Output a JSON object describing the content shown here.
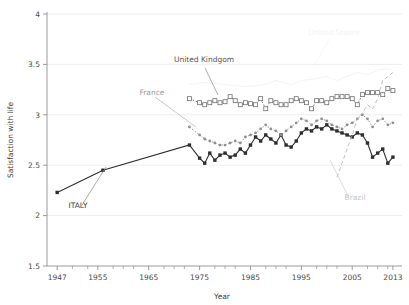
{
  "chart_data": {
    "type": "line",
    "title": "",
    "xlabel": "Year",
    "ylabel": "Satisfaction with life",
    "xlim": [
      1945,
      2014
    ],
    "ylim": [
      1.5,
      4
    ],
    "yticks": [
      "1.5",
      "2",
      "2.5",
      "3",
      "3.5",
      "4"
    ],
    "ytick_values": [
      1.5,
      2,
      2.5,
      3,
      3.5,
      4
    ],
    "xticks": [
      "1947",
      "1955",
      "1965",
      "1975",
      "1985",
      "1995",
      "2005",
      "2013"
    ],
    "xtick_values": [
      1947,
      1955,
      1965,
      1975,
      1985,
      1995,
      2005,
      2013
    ],
    "grid": "horizontal",
    "legend": "inline-annotations",
    "series": [
      {
        "name": "ITALY",
        "label": "ITALY",
        "color": "#2e2e2e",
        "marker": "filled-square",
        "linestyle": "solid",
        "points": [
          [
            1947,
            2.23
          ],
          [
            1956,
            2.45
          ],
          [
            1973,
            2.7
          ],
          [
            1975,
            2.57
          ],
          [
            1976,
            2.52
          ],
          [
            1977,
            2.62
          ],
          [
            1978,
            2.55
          ],
          [
            1979,
            2.6
          ],
          [
            1980,
            2.62
          ],
          [
            1981,
            2.58
          ],
          [
            1982,
            2.6
          ],
          [
            1983,
            2.66
          ],
          [
            1984,
            2.62
          ],
          [
            1985,
            2.7
          ],
          [
            1986,
            2.78
          ],
          [
            1987,
            2.74
          ],
          [
            1988,
            2.8
          ],
          [
            1989,
            2.76
          ],
          [
            1990,
            2.72
          ],
          [
            1991,
            2.8
          ],
          [
            1992,
            2.7
          ],
          [
            1993,
            2.68
          ],
          [
            1994,
            2.74
          ],
          [
            1995,
            2.82
          ],
          [
            1996,
            2.86
          ],
          [
            1997,
            2.84
          ],
          [
            1998,
            2.88
          ],
          [
            1999,
            2.86
          ],
          [
            2000,
            2.9
          ],
          [
            2001,
            2.86
          ],
          [
            2002,
            2.84
          ],
          [
            2003,
            2.82
          ],
          [
            2004,
            2.8
          ],
          [
            2005,
            2.78
          ],
          [
            2006,
            2.82
          ],
          [
            2007,
            2.8
          ],
          [
            2008,
            2.72
          ],
          [
            2009,
            2.58
          ],
          [
            2010,
            2.62
          ],
          [
            2011,
            2.66
          ],
          [
            2012,
            2.52
          ],
          [
            2013,
            2.58
          ]
        ]
      },
      {
        "name": "France",
        "label": "France",
        "color": "#8f8f8f",
        "marker": "small-dot",
        "linestyle": "dotted",
        "points": [
          [
            1973,
            2.88
          ],
          [
            1975,
            2.8
          ],
          [
            1976,
            2.76
          ],
          [
            1977,
            2.74
          ],
          [
            1978,
            2.72
          ],
          [
            1979,
            2.7
          ],
          [
            1980,
            2.7
          ],
          [
            1981,
            2.72
          ],
          [
            1982,
            2.74
          ],
          [
            1983,
            2.72
          ],
          [
            1984,
            2.78
          ],
          [
            1985,
            2.8
          ],
          [
            1986,
            2.82
          ],
          [
            1987,
            2.86
          ],
          [
            1988,
            2.9
          ],
          [
            1989,
            2.86
          ],
          [
            1990,
            2.84
          ],
          [
            1991,
            2.8
          ],
          [
            1992,
            2.84
          ],
          [
            1993,
            2.88
          ],
          [
            1994,
            2.92
          ],
          [
            1995,
            2.96
          ],
          [
            1996,
            2.94
          ],
          [
            1997,
            2.9
          ],
          [
            1998,
            2.94
          ],
          [
            1999,
            2.96
          ],
          [
            2000,
            2.94
          ],
          [
            2001,
            2.9
          ],
          [
            2002,
            2.88
          ],
          [
            2003,
            2.86
          ],
          [
            2004,
            2.9
          ],
          [
            2005,
            2.92
          ],
          [
            2006,
            2.96
          ],
          [
            2007,
            3.0
          ],
          [
            2008,
            2.96
          ],
          [
            2009,
            2.88
          ],
          [
            2010,
            2.94
          ],
          [
            2011,
            2.96
          ],
          [
            2012,
            2.9
          ],
          [
            2013,
            2.92
          ]
        ]
      },
      {
        "name": "United Kindgom",
        "label": "United Kindgom",
        "color": "#6f6f6f",
        "marker": "open-square",
        "linestyle": "dotted",
        "points": [
          [
            1973,
            3.16
          ],
          [
            1975,
            3.12
          ],
          [
            1976,
            3.1
          ],
          [
            1977,
            3.12
          ],
          [
            1978,
            3.14
          ],
          [
            1979,
            3.12
          ],
          [
            1980,
            3.13
          ],
          [
            1981,
            3.18
          ],
          [
            1982,
            3.14
          ],
          [
            1983,
            3.1
          ],
          [
            1984,
            3.12
          ],
          [
            1985,
            3.11
          ],
          [
            1986,
            3.1
          ],
          [
            1987,
            3.16
          ],
          [
            1988,
            3.06
          ],
          [
            1989,
            3.14
          ],
          [
            1990,
            3.12
          ],
          [
            1991,
            3.1
          ],
          [
            1992,
            3.1
          ],
          [
            1993,
            3.14
          ],
          [
            1994,
            3.16
          ],
          [
            1995,
            3.14
          ],
          [
            1996,
            3.12
          ],
          [
            1997,
            3.06
          ],
          [
            1998,
            3.14
          ],
          [
            1999,
            3.14
          ],
          [
            2000,
            3.12
          ],
          [
            2001,
            3.16
          ],
          [
            2002,
            3.18
          ],
          [
            2003,
            3.18
          ],
          [
            2004,
            3.18
          ],
          [
            2005,
            3.16
          ],
          [
            2006,
            3.1
          ],
          [
            2007,
            3.2
          ],
          [
            2008,
            3.22
          ],
          [
            2009,
            3.22
          ],
          [
            2010,
            3.22
          ],
          [
            2011,
            3.2
          ],
          [
            2012,
            3.26
          ],
          [
            2013,
            3.24
          ]
        ]
      },
      {
        "name": "Brazil",
        "label": "Brazil",
        "color": "#b9b9b9",
        "marker": "none",
        "linestyle": "dashed",
        "points": [
          [
            2002,
            2.38
          ],
          [
            2003,
            2.52
          ],
          [
            2004,
            2.66
          ],
          [
            2005,
            2.8
          ],
          [
            2006,
            2.96
          ],
          [
            2007,
            3.02
          ],
          [
            2008,
            3.1
          ],
          [
            2009,
            3.06
          ],
          [
            2010,
            3.16
          ],
          [
            2011,
            3.34
          ],
          [
            2012,
            3.38
          ],
          [
            2013,
            3.42
          ]
        ]
      },
      {
        "name": "United States",
        "label": "United States",
        "color": "#f2f2f2",
        "marker": "none",
        "linestyle": "solid",
        "points": [
          [
            1973,
            3.3
          ],
          [
            1976,
            3.32
          ],
          [
            1980,
            3.3
          ],
          [
            1984,
            3.28
          ],
          [
            1988,
            3.3
          ],
          [
            1990,
            3.34
          ],
          [
            1993,
            3.3
          ],
          [
            1995,
            3.34
          ],
          [
            1998,
            3.36
          ],
          [
            2000,
            3.38
          ],
          [
            2002,
            3.34
          ],
          [
            2004,
            3.38
          ],
          [
            2006,
            3.42
          ],
          [
            2008,
            3.4
          ],
          [
            2010,
            3.44
          ],
          [
            2012,
            3.46
          ],
          [
            2013,
            3.44
          ]
        ]
      }
    ],
    "annotations": [
      {
        "text": "ITALY",
        "series": "ITALY"
      },
      {
        "text": "France",
        "series": "France"
      },
      {
        "text": "United Kindgom",
        "series": "United Kindgom"
      },
      {
        "text": "Brazil",
        "series": "Brazil"
      },
      {
        "text": "United States",
        "series": "United States"
      }
    ]
  },
  "colors": {
    "italy": "#2e2e2e",
    "france": "#8f8f8f",
    "uk": "#6f6f6f",
    "brazil": "#b9b9b9",
    "us": "#f2f2f2",
    "grid": "#ededed",
    "axis": "#909090",
    "text": "#4a4a4a"
  }
}
